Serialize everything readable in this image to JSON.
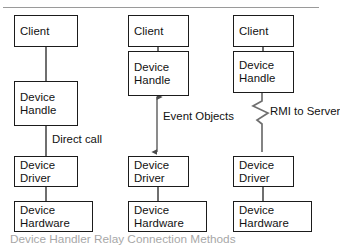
{
  "figure": {
    "caption": "Device Handler Relay Connection Methods",
    "top_rule": true,
    "colors": {
      "box_border": "#1b1b1b",
      "connector": "#6f6f6f",
      "rule": "#9a9a9a",
      "text": "#111111",
      "background": "#ffffff"
    }
  },
  "columns": [
    {
      "id": "direct-call",
      "nodes": [
        {
          "id": "client",
          "lines": [
            "Client"
          ]
        },
        {
          "id": "device-handle",
          "lines": [
            "Device",
            "Handle"
          ]
        },
        {
          "id": "device-driver",
          "lines": [
            "Device",
            "Driver"
          ]
        },
        {
          "id": "device-hardware",
          "lines": [
            "Device",
            "Hardware"
          ]
        }
      ],
      "edge_label": "Direct call",
      "connector_style": "plain"
    },
    {
      "id": "event-objects",
      "nodes": [
        {
          "id": "client",
          "lines": [
            "Client"
          ]
        },
        {
          "id": "device-handle",
          "lines": [
            "Device",
            "Handle"
          ]
        },
        {
          "id": "device-driver",
          "lines": [
            "Device",
            "Driver"
          ]
        },
        {
          "id": "device-hardware",
          "lines": [
            "Device",
            "Hardware"
          ]
        }
      ],
      "edge_label_lines": [
        "Event",
        "Objects"
      ],
      "connector_style": "double-arrow"
    },
    {
      "id": "rmi-to-server",
      "nodes": [
        {
          "id": "client",
          "lines": [
            "Client"
          ]
        },
        {
          "id": "device-handle",
          "lines": [
            "Device",
            "Handle"
          ]
        },
        {
          "id": "device-driver",
          "lines": [
            "Device",
            "Driver"
          ]
        },
        {
          "id": "device-hardware",
          "lines": [
            "Device",
            "Hardware"
          ]
        }
      ],
      "edge_label_lines": [
        "RMI to",
        "Server"
      ],
      "connector_style": "zigzag"
    }
  ]
}
